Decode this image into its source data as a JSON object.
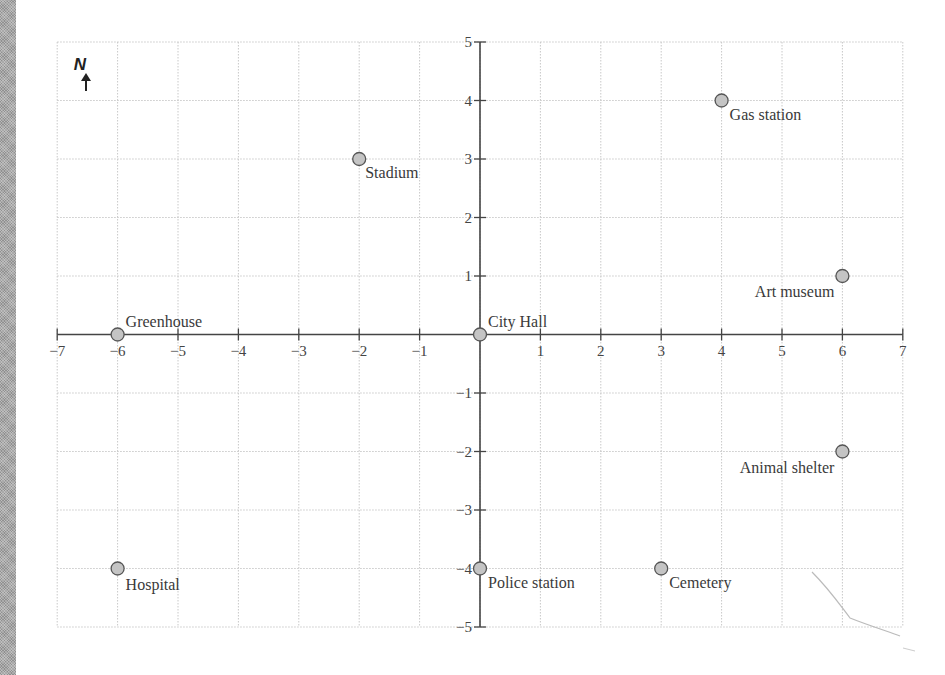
{
  "compass": {
    "label": "N",
    "icon": "north-arrow-icon"
  },
  "grid": {
    "xmin": -7,
    "xmax": 7,
    "ymin": -5,
    "ymax": 5
  },
  "x_ticks": [
    "−7",
    "−6",
    "−5",
    "−4",
    "−3",
    "−2",
    "−1",
    "1",
    "2",
    "3",
    "4",
    "5",
    "6",
    "7"
  ],
  "y_ticks": [
    "5",
    "4",
    "3",
    "2",
    "1",
    "−1",
    "−2",
    "−3",
    "−4",
    "−5"
  ],
  "locations": [
    {
      "name": "Greenhouse",
      "x": -6,
      "y": 0
    },
    {
      "name": "City Hall",
      "x": 0,
      "y": 0
    },
    {
      "name": "Stadium",
      "x": -2,
      "y": 3
    },
    {
      "name": "Gas station",
      "x": 4,
      "y": 4
    },
    {
      "name": "Art museum",
      "x": 6,
      "y": 1
    },
    {
      "name": "Animal shelter",
      "x": 6,
      "y": -2
    },
    {
      "name": "Hospital",
      "x": -6,
      "y": -4
    },
    {
      "name": "Police station",
      "x": 0,
      "y": -4
    },
    {
      "name": "Cemetery",
      "x": 3,
      "y": -4
    }
  ],
  "chart_data": {
    "type": "scatter",
    "title": "",
    "xlabel": "",
    "ylabel": "",
    "xlim": [
      -7,
      7
    ],
    "ylim": [
      -5,
      5
    ],
    "grid": true,
    "points": [
      {
        "label": "Greenhouse",
        "x": -6,
        "y": 0
      },
      {
        "label": "City Hall",
        "x": 0,
        "y": 0
      },
      {
        "label": "Stadium",
        "x": -2,
        "y": 3
      },
      {
        "label": "Gas station",
        "x": 4,
        "y": 4
      },
      {
        "label": "Art museum",
        "x": 6,
        "y": 1
      },
      {
        "label": "Animal shelter",
        "x": 6,
        "y": -2
      },
      {
        "label": "Hospital",
        "x": -6,
        "y": -4
      },
      {
        "label": "Police station",
        "x": 0,
        "y": -4
      },
      {
        "label": "Cemetery",
        "x": 3,
        "y": -4
      }
    ],
    "annotations": [
      "N (north arrow, top-left)"
    ]
  }
}
